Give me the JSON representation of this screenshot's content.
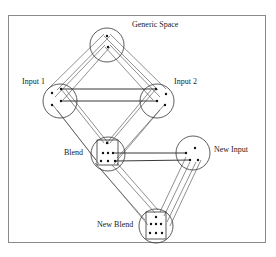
{
  "figure": {
    "labels": {
      "generic_space": "Generic Space",
      "input1": "Input 1",
      "input2": "Input 2",
      "blend": "Blend",
      "new_input": "New Input",
      "new_blend": "New Blend"
    },
    "colors": {
      "stroke": "#333333",
      "frame": "#8a8a8a",
      "background": "#ffffff"
    },
    "nodes": [
      {
        "id": "generic_space",
        "label": "Generic Space",
        "cx": 107,
        "cy": 45,
        "r": 17,
        "dots": 2
      },
      {
        "id": "input1",
        "label": "Input 1",
        "cx": 60,
        "cy": 101,
        "r": 17,
        "dots": 4
      },
      {
        "id": "input2",
        "label": "Input 2",
        "cx": 157,
        "cy": 101,
        "r": 17,
        "dots": 4
      },
      {
        "id": "blend",
        "label": "Blend",
        "cx": 108,
        "cy": 154,
        "r": 17,
        "dots": 7
      },
      {
        "id": "new_input",
        "label": "New Input",
        "cx": 193,
        "cy": 153,
        "r": 17,
        "dots": 4
      },
      {
        "id": "new_blend",
        "label": "New Blend",
        "cx": 156,
        "cy": 226,
        "r": 17,
        "dots": 7
      }
    ],
    "edges": [
      {
        "from": "generic_space",
        "to": "input1",
        "style": "double-parallel"
      },
      {
        "from": "generic_space",
        "to": "input2",
        "style": "double-parallel"
      },
      {
        "from": "input1",
        "to": "input2",
        "style": "solid-pair"
      },
      {
        "from": "input1",
        "to": "blend",
        "style": "double-parallel"
      },
      {
        "from": "input2",
        "to": "blend",
        "style": "double-parallel"
      },
      {
        "from": "blend",
        "to": "new_input",
        "style": "solid-pair"
      },
      {
        "from": "blend",
        "to": "new_blend",
        "style": "double-parallel"
      },
      {
        "from": "new_input",
        "to": "new_blend",
        "style": "double-parallel"
      }
    ]
  }
}
